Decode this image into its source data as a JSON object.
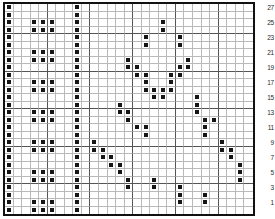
{
  "chart": {
    "type": "stitch-grid",
    "columns": 29,
    "rows": 28,
    "filled_symbol": "filled-square",
    "colors": {
      "filled": "#151515",
      "grid_minor": "#b9b9b9",
      "grid_major": "#555555",
      "border": "#111111",
      "background": "#ffffff",
      "label_text": "#2a2a2a"
    },
    "row_number_side": "right",
    "row_numbers": [
      27,
      25,
      23,
      21,
      19,
      17,
      15,
      13,
      11,
      9,
      7,
      5,
      3,
      1
    ],
    "row_numbers_start": 1,
    "row_numbers_step": 2,
    "major_gridline_every": 5,
    "filled_cells_by_row": [
      [
        0,
        8
      ],
      [
        0,
        8
      ],
      [
        0,
        3,
        4,
        5,
        8,
        18
      ],
      [
        0,
        3,
        4,
        5,
        8,
        18
      ],
      [
        0,
        8,
        16,
        20
      ],
      [
        0,
        8,
        16,
        20
      ],
      [
        0,
        3,
        4,
        5,
        8
      ],
      [
        0,
        3,
        4,
        5,
        8,
        14,
        21
      ],
      [
        0,
        8,
        14,
        15,
        20,
        21
      ],
      [
        0,
        8,
        15,
        16,
        19,
        20
      ],
      [
        0,
        3,
        4,
        5,
        8,
        16,
        19
      ],
      [
        0,
        3,
        4,
        5,
        8,
        16,
        17,
        18,
        19
      ],
      [
        0,
        8,
        17,
        18,
        22
      ],
      [
        0,
        8,
        13,
        22
      ],
      [
        0,
        3,
        4,
        5,
        8,
        13,
        14,
        22
      ],
      [
        0,
        3,
        4,
        5,
        8,
        14,
        23,
        24
      ],
      [
        0,
        8,
        15,
        16,
        23
      ],
      [
        0,
        8,
        16,
        23
      ],
      [
        0,
        3,
        4,
        5,
        8,
        10,
        25
      ],
      [
        0,
        3,
        4,
        5,
        8,
        10,
        11,
        25,
        26
      ],
      [
        0,
        8,
        11,
        12,
        26
      ],
      [
        0,
        8,
        12,
        13,
        27
      ],
      [
        0,
        3,
        4,
        5,
        8,
        13,
        27
      ],
      [
        0,
        3,
        4,
        5,
        8,
        14,
        17,
        27
      ],
      [
        0,
        8,
        14,
        17,
        20
      ],
      [
        0,
        8,
        20,
        23
      ],
      [
        0,
        3,
        4,
        5,
        8,
        20,
        23
      ],
      [
        0,
        3,
        4,
        5,
        8
      ]
    ]
  }
}
